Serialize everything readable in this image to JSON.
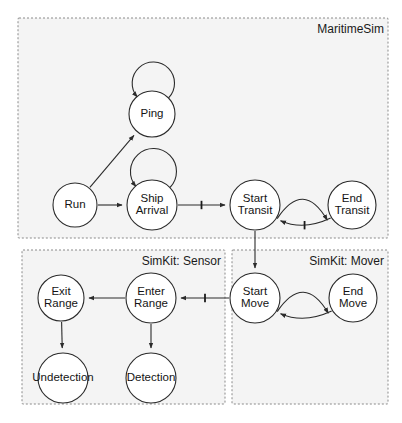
{
  "diagram": {
    "packages": [
      {
        "id": "maritimesim",
        "label": "MaritimeSim",
        "x": 18,
        "y": 18,
        "w": 370,
        "h": 220
      },
      {
        "id": "simkit_sensor",
        "label": "SimKit: Sensor",
        "x": 22,
        "y": 250,
        "w": 203,
        "h": 154
      },
      {
        "id": "simkit_mover",
        "label": "SimKit: Mover",
        "x": 232,
        "y": 250,
        "w": 156,
        "h": 154
      }
    ],
    "nodes": [
      {
        "id": "ping",
        "label": "Ping",
        "lines": [
          "Ping"
        ],
        "cx": 152,
        "cy": 114,
        "r": 23,
        "package": "maritimesim"
      },
      {
        "id": "run",
        "label": "Run",
        "lines": [
          "Run"
        ],
        "cx": 75,
        "cy": 205,
        "r": 22,
        "package": "maritimesim"
      },
      {
        "id": "ship_arrival",
        "label": "Ship Arrival",
        "lines": [
          "Ship",
          "Arrival"
        ],
        "cx": 152,
        "cy": 205,
        "r": 25,
        "package": "maritimesim"
      },
      {
        "id": "start_transit",
        "label": "Start Transit",
        "lines": [
          "Start",
          "Transit"
        ],
        "cx": 255,
        "cy": 205,
        "r": 25,
        "package": "maritimesim"
      },
      {
        "id": "end_transit",
        "label": "End Transit",
        "lines": [
          "End",
          "Transit"
        ],
        "cx": 352,
        "cy": 205,
        "r": 24,
        "package": "maritimesim"
      },
      {
        "id": "exit_range",
        "label": "Exit Range",
        "lines": [
          "Exit",
          "Range"
        ],
        "cx": 61,
        "cy": 298,
        "r": 23,
        "package": "simkit_sensor"
      },
      {
        "id": "enter_range",
        "label": "Enter Range",
        "lines": [
          "Enter",
          "Range"
        ],
        "cx": 151,
        "cy": 298,
        "r": 25,
        "package": "simkit_sensor"
      },
      {
        "id": "undetection",
        "label": "Undetection",
        "lines": [
          "Undetection"
        ],
        "cx": 63,
        "cy": 378,
        "r": 25,
        "package": "simkit_sensor"
      },
      {
        "id": "detection",
        "label": "Detection",
        "lines": [
          "Detection"
        ],
        "cx": 151,
        "cy": 378,
        "r": 25,
        "package": "simkit_sensor"
      },
      {
        "id": "start_move",
        "label": "Start Move",
        "lines": [
          "Start",
          "Move"
        ],
        "cx": 255,
        "cy": 298,
        "r": 25,
        "package": "simkit_mover"
      },
      {
        "id": "end_move",
        "label": "End Move",
        "lines": [
          "End",
          "Move"
        ],
        "cx": 353,
        "cy": 298,
        "r": 24,
        "package": "simkit_mover"
      }
    ],
    "edges": [
      {
        "id": "ping-self",
        "from": "ping",
        "to": "ping",
        "kind": "self-loop",
        "cancelling": false
      },
      {
        "id": "run-ping",
        "from": "run",
        "to": "ping",
        "kind": "straight",
        "cancelling": false
      },
      {
        "id": "run-ship_arrival",
        "from": "run",
        "to": "ship_arrival",
        "kind": "straight",
        "cancelling": false
      },
      {
        "id": "ship_arrival-self",
        "from": "ship_arrival",
        "to": "ship_arrival",
        "kind": "self-loop",
        "cancelling": false
      },
      {
        "id": "ship_arrival-start_transit",
        "from": "ship_arrival",
        "to": "start_transit",
        "kind": "straight",
        "cancelling": true
      },
      {
        "id": "start_transit-end_transit",
        "from": "start_transit",
        "to": "end_transit",
        "kind": "curve-up",
        "cancelling": false
      },
      {
        "id": "end_transit-start_transit",
        "from": "end_transit",
        "to": "start_transit",
        "kind": "curve-down",
        "cancelling": true
      },
      {
        "id": "start_transit-start_move",
        "from": "start_transit",
        "to": "start_move",
        "kind": "straight",
        "cancelling": false
      },
      {
        "id": "start_move-enter_range",
        "from": "start_move",
        "to": "enter_range",
        "kind": "straight",
        "cancelling": true
      },
      {
        "id": "enter_range-exit_range",
        "from": "enter_range",
        "to": "exit_range",
        "kind": "straight",
        "cancelling": false
      },
      {
        "id": "enter_range-detection",
        "from": "enter_range",
        "to": "detection",
        "kind": "straight",
        "cancelling": false
      },
      {
        "id": "exit_range-undetection",
        "from": "exit_range",
        "to": "undetection",
        "kind": "straight",
        "cancelling": false
      },
      {
        "id": "start_move-end_move",
        "from": "start_move",
        "to": "end_move",
        "kind": "curve-up",
        "cancelling": false
      },
      {
        "id": "end_move-start_move",
        "from": "end_move",
        "to": "start_move",
        "kind": "curve-down",
        "cancelling": false
      }
    ],
    "colors": {
      "package_fill": "#f4f4f4",
      "package_border": "#8a8a8a",
      "node_fill": "#ffffff",
      "node_stroke": "#2b2b2b",
      "edge_stroke": "#2b2b2b",
      "text": "#141414",
      "background": "#ffffff"
    }
  }
}
